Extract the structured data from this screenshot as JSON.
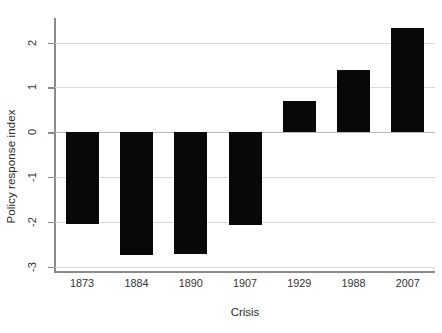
{
  "chart_data": {
    "type": "bar",
    "title": "",
    "xlabel": "Crisis",
    "ylabel": "Policy response index",
    "categories": [
      "1873",
      "1884",
      "1890",
      "1907",
      "1929",
      "1988",
      "2007"
    ],
    "values": [
      -2.05,
      -2.75,
      -2.72,
      -2.07,
      0.7,
      1.4,
      2.33
    ],
    "ytick_labels": [
      "2",
      "1",
      "0",
      "-1",
      "-2",
      "-3"
    ],
    "ytick_values": [
      2,
      1,
      0,
      -1,
      -2,
      -3
    ],
    "ylim": [
      -3.1,
      2.55
    ],
    "grid": "horizontal",
    "legend": "none",
    "bar_color": "#080808",
    "grid_color": "#d9d9d9",
    "axis_color": "#8a8a8a",
    "series": [
      {
        "name": "Policy response index",
        "values": [
          -2.05,
          -2.75,
          -2.72,
          -2.07,
          0.7,
          1.4,
          2.33
        ]
      }
    ]
  }
}
